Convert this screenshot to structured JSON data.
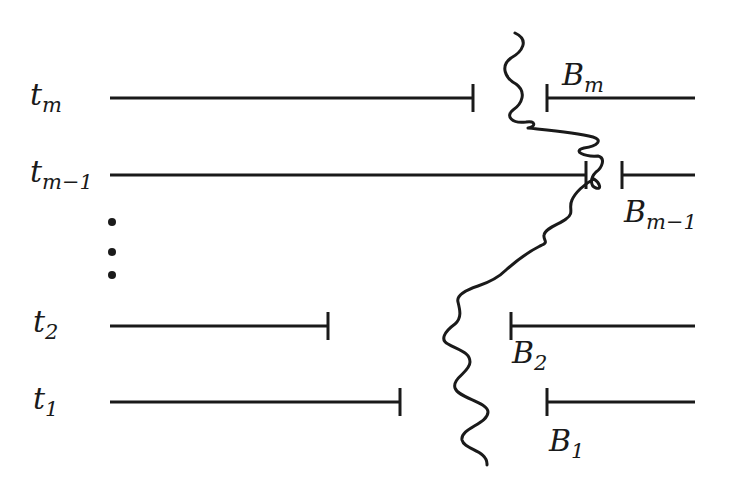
{
  "diagram": {
    "type": "interval-boundary-diagram",
    "stroke_color": "#1a1a1a",
    "rows": [
      {
        "id": "tm",
        "label": "t",
        "label_sub": "m",
        "y": 98,
        "left_segment": {
          "x1": 110,
          "x2": 473
        },
        "right_segment": {
          "x1": 547,
          "x2": 695
        },
        "boundary_label": "B",
        "boundary_sub": "m",
        "boundary_label_position": "above"
      },
      {
        "id": "tm-1",
        "label": "t",
        "label_sub": "m−1",
        "y": 175,
        "left_segment": {
          "x1": 110,
          "x2": 586
        },
        "right_segment": {
          "x1": 622,
          "x2": 695
        },
        "boundary_label": "B",
        "boundary_sub": "m−1",
        "boundary_label_position": "below"
      },
      {
        "id": "t2",
        "label": "t",
        "label_sub": "2",
        "y": 326,
        "left_segment": {
          "x1": 110,
          "x2": 328
        },
        "right_segment": {
          "x1": 511,
          "x2": 695
        },
        "boundary_label": "B",
        "boundary_sub": "2",
        "boundary_label_position": "below"
      },
      {
        "id": "t1",
        "label": "t",
        "label_sub": "1",
        "y": 402,
        "left_segment": {
          "x1": 110,
          "x2": 400
        },
        "right_segment": {
          "x1": 547,
          "x2": 695
        },
        "boundary_label": "B",
        "boundary_sub": "1",
        "boundary_label_position": "below"
      }
    ],
    "ellipsis": {
      "symbol": "vertical-dots",
      "count": 3,
      "x": 112,
      "ys": [
        222,
        252,
        275
      ]
    },
    "labels": {
      "t_m": {
        "base": "t",
        "sub": "m"
      },
      "t_m_minus_1": {
        "base": "t",
        "sub": "m−1"
      },
      "t_2": {
        "base": "t",
        "sub": "2"
      },
      "t_1": {
        "base": "t",
        "sub": "1"
      },
      "B_m": {
        "base": "B",
        "sub": "m"
      },
      "B_m_minus_1": {
        "base": "B",
        "sub": "m−1"
      },
      "B_2": {
        "base": "B",
        "sub": "2"
      },
      "B_1": {
        "base": "B",
        "sub": "1"
      }
    },
    "curve": {
      "description": "wavy boundary curve",
      "start": [
        515,
        33
      ],
      "end": [
        487,
        465
      ]
    }
  }
}
